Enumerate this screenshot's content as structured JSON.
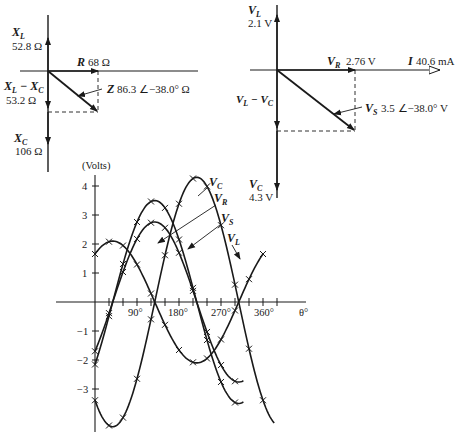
{
  "impedance_phasor": {
    "xl": {
      "symbol": "X",
      "sub": "L",
      "value": "52.8 Ω"
    },
    "r": {
      "symbol": "R",
      "value": "68 Ω"
    },
    "xl_minus_xc": {
      "symbol_a": "X",
      "sub_a": "L",
      "minus": " − ",
      "symbol_b": "X",
      "sub_b": "C",
      "value": "53.2 Ω"
    },
    "z": {
      "symbol": "Z",
      "value": "86.3 ∠−38.0° Ω"
    },
    "xc": {
      "symbol": "X",
      "sub": "C",
      "value": "106 Ω"
    }
  },
  "voltage_phasor": {
    "vl": {
      "symbol": "V",
      "sub": "L",
      "value": "2.1 V"
    },
    "vr": {
      "symbol": "V",
      "sub": "R",
      "value": "2.76 V"
    },
    "i": {
      "symbol": "I",
      "value": "40.6 mA"
    },
    "vl_minus_vc": {
      "symbol_a": "V",
      "sub_a": "L",
      "minus": " − ",
      "symbol_b": "V",
      "sub_b": "C"
    },
    "vs": {
      "symbol": "V",
      "sub": "S",
      "value": "3.5 ∠−38.0° V"
    },
    "vc": {
      "symbol": "V",
      "sub": "C",
      "value": "4.3 V"
    }
  },
  "waveform": {
    "y_axis_label": "(Volts)",
    "x_axis_label": "θ°",
    "y_ticks": [
      "4",
      "3",
      "2",
      "1",
      "−1",
      "−2",
      "−3"
    ],
    "x_ticks": [
      "90°",
      "180°",
      "270°",
      "360°"
    ],
    "curve_labels": {
      "vc": {
        "symbol": "V",
        "sub": "C"
      },
      "vr": {
        "symbol": "V",
        "sub": "R"
      },
      "vs": {
        "symbol": "V",
        "sub": "S"
      },
      "vl": {
        "symbol": "V",
        "sub": "L"
      }
    }
  },
  "chart_data": {
    "type": "line",
    "title": "",
    "xlabel": "θ°",
    "ylabel": "(Volts)",
    "x_ticks": [
      90,
      180,
      270,
      360
    ],
    "y_ticks": [
      -3,
      -2,
      -1,
      1,
      2,
      3,
      4
    ],
    "ylim": [
      -4.3,
      4.4
    ],
    "xlim": [
      0,
      410
    ],
    "grid": false,
    "series": [
      {
        "name": "V_C",
        "amplitude": 4.3,
        "phase_deg": -128,
        "description": "peak 4.3 V near 218°"
      },
      {
        "name": "V_R",
        "amplitude": 2.76,
        "phase_deg": -38,
        "description": "peak 2.76 V near 128°"
      },
      {
        "name": "V_S",
        "amplitude": 3.5,
        "phase_deg": -38,
        "description": "peak 3.5 V near 128°"
      },
      {
        "name": "V_L",
        "amplitude": 2.1,
        "phase_deg": 52,
        "description": "peak 2.1 V near 38°, zero crossing at 128°"
      }
    ]
  }
}
